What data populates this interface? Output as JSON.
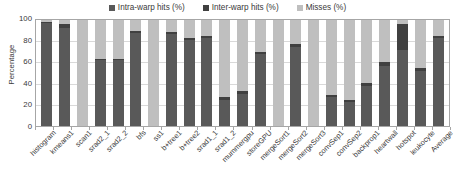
{
  "chart_data": {
    "type": "bar",
    "title": "",
    "subtitle": "",
    "xlabel": "",
    "ylabel": "Percentage",
    "ylim": [
      0,
      100
    ],
    "yticks": [
      0,
      20,
      40,
      60,
      80,
      100
    ],
    "grid": true,
    "stacked": true,
    "stack_total": 100,
    "legend_position": "top-center",
    "categories": [
      "histogram",
      "kmeans1",
      "scan1",
      "srad2_1",
      "srad2_2",
      "bfs",
      "ss1",
      "b+tree1",
      "b+tree2",
      "srad1_1",
      "srad1_2",
      "mummergpu",
      "storeGPU",
      "mergeSort1",
      "mergeSort2",
      "mergeSort3",
      "convSep1",
      "convSep2",
      "backprop1",
      "heartwall",
      "hotspot",
      "leukocyte",
      "Average"
    ],
    "series": [
      {
        "name": "Intra-warp hits (%)",
        "color": "#595959",
        "values": [
          97,
          92,
          0,
          62,
          62,
          88,
          0,
          87,
          81,
          83,
          25,
          30,
          68,
          0,
          75,
          0,
          27,
          23,
          38,
          57,
          72,
          52,
          83
        ]
      },
      {
        "name": "Inter-warp hits (%)",
        "color": "#404040",
        "values": [
          1,
          4,
          0,
          1,
          1,
          2,
          0,
          2,
          2,
          2,
          2,
          3,
          2,
          0,
          2,
          0,
          2,
          2,
          3,
          3,
          24,
          3,
          2
        ]
      },
      {
        "name": "Misses (%)",
        "color": "#bfbfbf",
        "values": [
          2,
          4,
          100,
          37,
          37,
          10,
          100,
          11,
          17,
          15,
          73,
          67,
          30,
          100,
          23,
          100,
          71,
          75,
          59,
          40,
          4,
          45,
          15
        ]
      }
    ]
  },
  "axis": {
    "y_label": "Percentage",
    "y_ticks": [
      "100",
      "80",
      "60",
      "40",
      "20",
      "0"
    ]
  },
  "legend": {
    "items": [
      {
        "label": "Intra-warp hits (%)",
        "color": "#595959"
      },
      {
        "label": "Inter-warp hits (%)",
        "color": "#404040"
      },
      {
        "label": "Misses (%)",
        "color": "#bfbfbf"
      }
    ]
  }
}
